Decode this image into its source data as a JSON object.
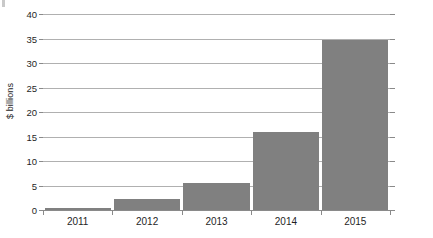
{
  "chart_data": {
    "type": "bar",
    "title": "",
    "subtitle": "",
    "xlabel": "",
    "ylabel": "$ billions",
    "categories": [
      "2011",
      "2012",
      "2013",
      "2014",
      "2015"
    ],
    "values": [
      0.5,
      2.3,
      5.5,
      16.0,
      34.7
    ],
    "series": [
      {
        "name": "",
        "values": [
          0.5,
          2.3,
          5.5,
          16.0,
          34.7
        ]
      }
    ],
    "ylim": [
      0,
      40
    ],
    "ytick_labels": [
      "0",
      "5",
      "10",
      "15",
      "20",
      "25",
      "30",
      "35",
      "40"
    ],
    "ytick_values": [
      0,
      5,
      10,
      15,
      20,
      25,
      30,
      35,
      40
    ],
    "grid": true,
    "legend": "none",
    "bar_color": "#808080",
    "gridline_color": "#b0b0b0",
    "axis_color": "#8a8a8a",
    "background_color": "#ffffff"
  }
}
